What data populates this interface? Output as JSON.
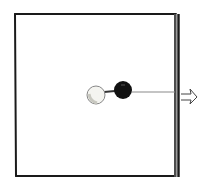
{
  "diagram": {
    "colors": {
      "background": "#ffffff",
      "outline": "#1a1a1a",
      "wall_inner": "#9a9a9a",
      "white_ball_fill": "#f4f4f0",
      "white_ball_shade": "#c8c8c0",
      "black_ball_fill": "#111111",
      "string": "#8a8a8a"
    },
    "elements": {
      "box": {
        "label": ""
      },
      "right_wall": {
        "label": ""
      },
      "white_ball": {
        "label": ""
      },
      "black_ball": {
        "label": ""
      },
      "string": {
        "label": ""
      },
      "arrow": {
        "label": "",
        "direction": "right"
      }
    }
  }
}
